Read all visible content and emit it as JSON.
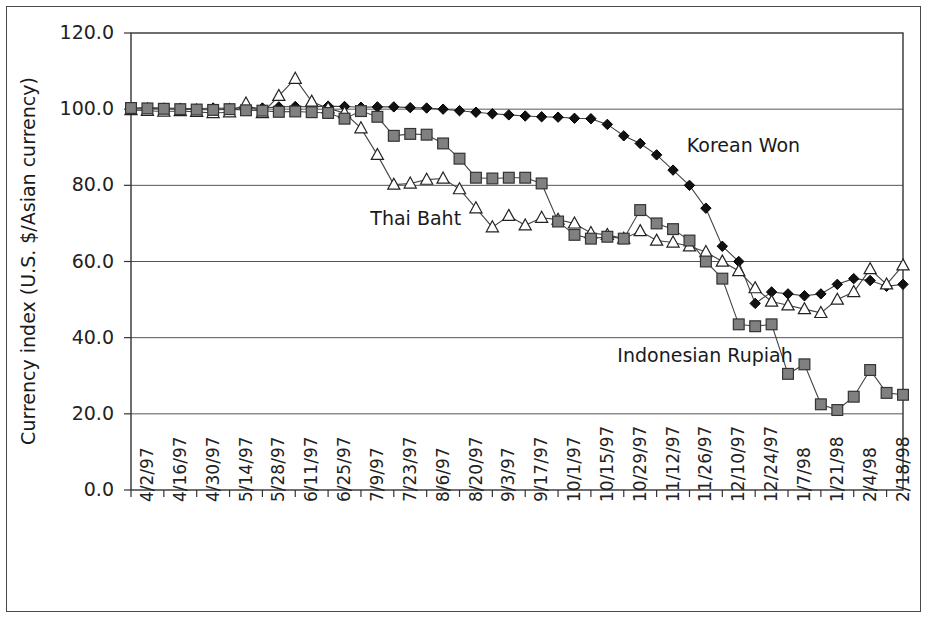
{
  "chart_data": {
    "type": "line",
    "title": "",
    "xlabel": "",
    "ylabel": "Currency index (U.S. $/Asian currency)",
    "ylim": [
      0,
      120
    ],
    "ytick_labels": [
      "0.0",
      "20.0",
      "40.0",
      "60.0",
      "80.0",
      "100.0",
      "120.0"
    ],
    "ytick_values": [
      0,
      20,
      40,
      60,
      80,
      100,
      120
    ],
    "grid": "horizontal",
    "legend_position": "inline-annotations",
    "x_tick_labels": [
      "4/2/97",
      "4/16/97",
      "4/30/97",
      "5/14/97",
      "5/28/97",
      "6/11/97",
      "6/25/97",
      "7/9/97",
      "7/23/97",
      "8/6/97",
      "8/20/97",
      "9/3/97",
      "9/17/97",
      "10/1/97",
      "10/15/97",
      "10/29/97",
      "11/12/97",
      "11/26/97",
      "12/10/97",
      "12/24/97",
      "1/7/98",
      "1/21/98",
      "2/4/98",
      "2/18/98"
    ],
    "x": [
      "4/2/97",
      "4/9/97",
      "4/16/97",
      "4/23/97",
      "4/30/97",
      "5/7/97",
      "5/14/97",
      "5/21/97",
      "5/28/97",
      "6/4/97",
      "6/11/97",
      "6/18/97",
      "6/25/97",
      "7/2/97",
      "7/9/97",
      "7/16/97",
      "7/23/97",
      "7/30/97",
      "8/6/97",
      "8/13/97",
      "8/20/97",
      "8/27/97",
      "9/3/97",
      "9/10/97",
      "9/17/97",
      "9/24/97",
      "10/1/97",
      "10/8/97",
      "10/15/97",
      "10/22/97",
      "10/29/97",
      "11/5/97",
      "11/12/97",
      "11/19/97",
      "11/26/97",
      "12/3/97",
      "12/10/97",
      "12/17/97",
      "12/24/97",
      "12/31/97",
      "1/7/98",
      "1/14/98",
      "1/21/98",
      "1/28/98",
      "2/4/98",
      "2/11/98",
      "2/18/98",
      "2/25/98"
    ],
    "series": [
      {
        "name": "Korean Won",
        "marker": "filled-diamond",
        "color": "#111111",
        "fill": "#111111",
        "values": [
          100.2,
          100.4,
          100.3,
          100.2,
          100.1,
          100.3,
          100.2,
          100.4,
          100.3,
          100.6,
          100.7,
          100.6,
          100.8,
          100.7,
          100.5,
          100.6,
          100.6,
          100.4,
          100.3,
          100.0,
          99.6,
          99.2,
          98.8,
          98.5,
          98.2,
          98.0,
          97.9,
          97.6,
          97.5,
          96.0,
          93.0,
          91.0,
          88.0,
          84.0,
          80.0,
          74.0,
          64.0,
          60.0,
          49.0,
          52.0,
          51.5,
          51.0,
          51.5,
          54.0,
          55.5,
          55.0,
          53.5,
          54.0
        ]
      },
      {
        "name": "Thai Baht",
        "marker": "open-triangle",
        "color": "#1a1a1a",
        "fill": "#ffffff",
        "values": [
          99.8,
          99.6,
          99.4,
          99.5,
          99.3,
          99.0,
          99.2,
          101.5,
          99.0,
          103.5,
          108.0,
          102.0,
          100.2,
          99.0,
          95.0,
          88.0,
          80.2,
          80.5,
          81.5,
          81.8,
          79.0,
          74.0,
          69.0,
          72.0,
          69.5,
          71.5,
          71.0,
          70.0,
          67.5,
          67.0,
          66.0,
          68.0,
          65.5,
          65.0,
          64.0,
          62.5,
          60.0,
          57.5,
          53.0,
          49.5,
          48.5,
          47.5,
          46.5,
          50.0,
          52.0,
          58.0,
          54.0,
          59.0
        ]
      },
      {
        "name": "Indonesian Rupiah",
        "marker": "filled-square",
        "color": "#808080",
        "fill": "#808080",
        "values": [
          100.3,
          100.2,
          100.1,
          100.0,
          99.9,
          99.8,
          100.0,
          99.7,
          99.6,
          99.3,
          99.4,
          99.2,
          99.0,
          97.5,
          99.5,
          98.0,
          93.0,
          93.5,
          93.3,
          91.0,
          87.0,
          82.0,
          81.8,
          82.0,
          82.0,
          80.5,
          70.5,
          67.0,
          66.0,
          66.5,
          66.0,
          73.5,
          70.0,
          68.5,
          65.5,
          60.0,
          55.5,
          43.5,
          43.0,
          43.5,
          30.5,
          33.0,
          22.5,
          21.0,
          24.5,
          31.5,
          25.5,
          25.0
        ]
      }
    ],
    "annotations": [
      {
        "text": "Korean Won",
        "x_pos": 0.72,
        "y_value": 90
      },
      {
        "text": "Thai Baht",
        "x_pos": 0.31,
        "y_value": 71
      },
      {
        "text": "Indonesian Rupiah",
        "x_pos": 0.63,
        "y_value": 35
      }
    ]
  }
}
